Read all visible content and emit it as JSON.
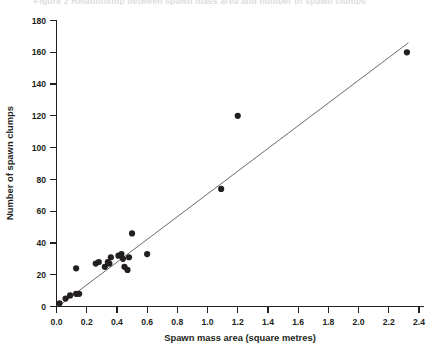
{
  "figure": {
    "top_caption_fragment": "Figure 2  Relationship between spawn mass area and number of spawn clumps"
  },
  "chart_data": {
    "type": "scatter",
    "title": "",
    "xlabel": "Spawn mass area (square metres)",
    "ylabel": "Number of spawn clumps",
    "xlim": [
      0.0,
      2.4
    ],
    "ylim": [
      0,
      180
    ],
    "xticks": [
      0.0,
      0.2,
      0.4,
      0.6,
      0.8,
      1.0,
      1.2,
      1.4,
      1.6,
      1.8,
      2.0,
      2.2,
      2.4
    ],
    "xticklabels": [
      "0.0",
      "0.2",
      "0.4",
      "0.6",
      "0.8",
      "1.0",
      "1.2",
      "1.4",
      "1.6",
      "1.8",
      "2.0",
      "2.2",
      "2.4"
    ],
    "yticks": [
      0,
      20,
      40,
      60,
      80,
      100,
      120,
      140,
      160,
      180
    ],
    "yticklabels": [
      "0",
      "20",
      "40",
      "60",
      "80",
      "100",
      "120",
      "140",
      "160",
      "180"
    ],
    "grid": false,
    "legend": false,
    "marker_color": "#231f20",
    "marker_size": 3.1,
    "line_color": "#58595b",
    "points": [
      {
        "x": 0.02,
        "y": 2
      },
      {
        "x": 0.06,
        "y": 5
      },
      {
        "x": 0.09,
        "y": 7
      },
      {
        "x": 0.13,
        "y": 8
      },
      {
        "x": 0.15,
        "y": 8
      },
      {
        "x": 0.13,
        "y": 24
      },
      {
        "x": 0.26,
        "y": 27
      },
      {
        "x": 0.28,
        "y": 28
      },
      {
        "x": 0.32,
        "y": 25
      },
      {
        "x": 0.34,
        "y": 28
      },
      {
        "x": 0.35,
        "y": 27
      },
      {
        "x": 0.36,
        "y": 31
      },
      {
        "x": 0.41,
        "y": 32
      },
      {
        "x": 0.43,
        "y": 33
      },
      {
        "x": 0.44,
        "y": 30
      },
      {
        "x": 0.45,
        "y": 25
      },
      {
        "x": 0.47,
        "y": 23
      },
      {
        "x": 0.5,
        "y": 46
      },
      {
        "x": 0.48,
        "y": 31
      },
      {
        "x": 0.6,
        "y": 33
      },
      {
        "x": 1.09,
        "y": 74
      },
      {
        "x": 1.2,
        "y": 120
      },
      {
        "x": 2.32,
        "y": 160
      }
    ],
    "fit_line": {
      "label": "regression line",
      "x_start": 0.01,
      "y_start": 0,
      "x_end": 2.33,
      "y_end": 166
    }
  }
}
